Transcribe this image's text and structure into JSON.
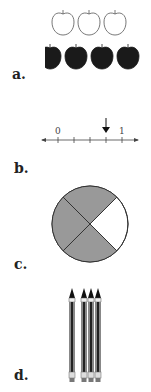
{
  "items": [
    {
      "label": "a.",
      "type": "apples",
      "outlined_count": 3,
      "filled_count": 4
    },
    {
      "label": "b.",
      "type": "number-line",
      "tick_labels": [
        "0",
        "1"
      ],
      "divisions": 4,
      "arrow_at_division": 3
    },
    {
      "label": "c.",
      "type": "circle",
      "parts": 4,
      "shaded_parts": 3,
      "shade_color": "#999999"
    },
    {
      "label": "d.",
      "type": "pencils",
      "single_count": 1,
      "group_count": 3
    }
  ]
}
